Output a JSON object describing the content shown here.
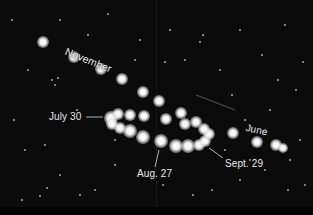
{
  "colors": {
    "sky": "#0b0b0b",
    "label": "#ececec",
    "leader_line": "#d8d8d8",
    "planet": "#ffffff"
  },
  "labels": {
    "november": "November",
    "july30": "July 30",
    "aug27": "Aug. 27",
    "sept29": "Sept. 29",
    "june": "June"
  },
  "mars_positions": [
    {
      "x": 43,
      "y": 42,
      "r": 5
    },
    {
      "x": 74,
      "y": 57,
      "r": 5
    },
    {
      "x": 101,
      "y": 69,
      "r": 5
    },
    {
      "x": 122,
      "y": 79,
      "r": 5
    },
    {
      "x": 143,
      "y": 92,
      "r": 5
    },
    {
      "x": 159,
      "y": 101,
      "r": 5
    },
    {
      "x": 111,
      "y": 118,
      "r": 6
    },
    {
      "x": 118,
      "y": 114,
      "r": 5
    },
    {
      "x": 130,
      "y": 115,
      "r": 5
    },
    {
      "x": 144,
      "y": 116,
      "r": 5
    },
    {
      "x": 112,
      "y": 124,
      "r": 5
    },
    {
      "x": 120,
      "y": 128,
      "r": 5
    },
    {
      "x": 130,
      "y": 131,
      "r": 6
    },
    {
      "x": 143,
      "y": 137,
      "r": 6
    },
    {
      "x": 161,
      "y": 141,
      "r": 6
    },
    {
      "x": 176,
      "y": 146,
      "r": 6
    },
    {
      "x": 188,
      "y": 146,
      "r": 6
    },
    {
      "x": 199,
      "y": 145,
      "r": 5
    },
    {
      "x": 205,
      "y": 141,
      "r": 5
    },
    {
      "x": 209,
      "y": 134,
      "r": 5
    },
    {
      "x": 204,
      "y": 129,
      "r": 5
    },
    {
      "x": 181,
      "y": 113,
      "r": 5
    },
    {
      "x": 166,
      "y": 119,
      "r": 5
    },
    {
      "x": 185,
      "y": 124,
      "r": 5
    },
    {
      "x": 196,
      "y": 122,
      "r": 5
    },
    {
      "x": 233,
      "y": 133,
      "r": 5
    },
    {
      "x": 257,
      "y": 142,
      "r": 5
    },
    {
      "x": 276,
      "y": 145,
      "r": 5
    },
    {
      "x": 283,
      "y": 148,
      "r": 4
    }
  ],
  "background_stars": [
    {
      "x": 12,
      "y": 20,
      "r": 0.8
    },
    {
      "x": 28,
      "y": 70,
      "r": 0.7
    },
    {
      "x": 55,
      "y": 85,
      "r": 0.9
    },
    {
      "x": 60,
      "y": 20,
      "r": 0.7
    },
    {
      "x": 88,
      "y": 35,
      "r": 0.8
    },
    {
      "x": 108,
      "y": 14,
      "r": 0.7
    },
    {
      "x": 52,
      "y": 80,
      "r": 1.0
    },
    {
      "x": 58,
      "y": 78,
      "r": 1.0
    },
    {
      "x": 140,
      "y": 40,
      "r": 0.8
    },
    {
      "x": 170,
      "y": 30,
      "r": 0.8
    },
    {
      "x": 185,
      "y": 60,
      "r": 1.0
    },
    {
      "x": 200,
      "y": 42,
      "r": 0.8
    },
    {
      "x": 220,
      "y": 70,
      "r": 0.9
    },
    {
      "x": 240,
      "y": 30,
      "r": 0.7
    },
    {
      "x": 262,
      "y": 55,
      "r": 0.9
    },
    {
      "x": 285,
      "y": 25,
      "r": 0.8
    },
    {
      "x": 303,
      "y": 62,
      "r": 1.0
    },
    {
      "x": 296,
      "y": 90,
      "r": 0.8
    },
    {
      "x": 165,
      "y": 62,
      "r": 1.1
    },
    {
      "x": 203,
      "y": 35,
      "r": 0.7
    },
    {
      "x": 232,
      "y": 95,
      "r": 0.8
    },
    {
      "x": 278,
      "y": 80,
      "r": 0.8
    },
    {
      "x": 245,
      "y": 120,
      "r": 1.0
    },
    {
      "x": 14,
      "y": 120,
      "r": 0.8
    },
    {
      "x": 25,
      "y": 150,
      "r": 0.7
    },
    {
      "x": 45,
      "y": 145,
      "r": 0.8
    },
    {
      "x": 60,
      "y": 175,
      "r": 0.8
    },
    {
      "x": 80,
      "y": 195,
      "r": 0.9
    },
    {
      "x": 47,
      "y": 188,
      "r": 1.0
    },
    {
      "x": 40,
      "y": 196,
      "r": 0.8
    },
    {
      "x": 22,
      "y": 200,
      "r": 0.8
    },
    {
      "x": 95,
      "y": 190,
      "r": 0.8
    },
    {
      "x": 115,
      "y": 165,
      "r": 0.8
    },
    {
      "x": 212,
      "y": 190,
      "r": 0.8
    },
    {
      "x": 240,
      "y": 180,
      "r": 0.8
    },
    {
      "x": 265,
      "y": 170,
      "r": 0.9
    },
    {
      "x": 288,
      "y": 190,
      "r": 0.8
    },
    {
      "x": 305,
      "y": 185,
      "r": 1.0
    },
    {
      "x": 193,
      "y": 195,
      "r": 0.7
    },
    {
      "x": 163,
      "y": 185,
      "r": 0.8
    },
    {
      "x": 115,
      "y": 140,
      "r": 0.8
    },
    {
      "x": 250,
      "y": 160,
      "r": 0.7
    },
    {
      "x": 300,
      "y": 140,
      "r": 0.8
    },
    {
      "x": 135,
      "y": 60,
      "r": 0.7
    },
    {
      "x": 77,
      "y": 110,
      "r": 0.7
    },
    {
      "x": 270,
      "y": 110,
      "r": 0.7
    },
    {
      "x": 225,
      "y": 150,
      "r": 0.7
    },
    {
      "x": 290,
      "y": 160,
      "r": 0.7
    }
  ],
  "trail": {
    "x1": 196,
    "y1": 95,
    "x2": 235,
    "y2": 110
  }
}
